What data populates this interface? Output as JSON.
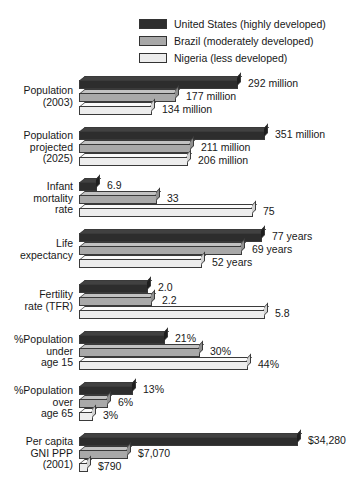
{
  "legend": {
    "items": [
      {
        "label": "United States (highly developed)",
        "key": "us",
        "color": "#2d2d2d"
      },
      {
        "label": "Brazil (moderately developed)",
        "key": "br",
        "color": "#a9a9a9"
      },
      {
        "label": "Nigeria (less developed)",
        "key": "ng",
        "color": "#ededed"
      }
    ]
  },
  "chart_data": {
    "type": "bar",
    "title": "",
    "xlabel": "",
    "ylabel": "",
    "orientation": "horizontal",
    "grid": false,
    "legend_position": "top-right",
    "series": [
      {
        "name": "United States (highly developed)",
        "key": "us",
        "color": "#2d2d2d"
      },
      {
        "name": "Brazil (moderately developed)",
        "key": "br",
        "color": "#a9a9a9"
      },
      {
        "name": "Nigeria (less developed)",
        "key": "ng",
        "color": "#ededed"
      }
    ],
    "groups": [
      {
        "id": "population-2003",
        "label_lines": [
          "Population",
          "(2003)"
        ],
        "unit": "million",
        "bars": [
          {
            "series": "us",
            "value": 292,
            "value_label": "292 million",
            "px": 159
          },
          {
            "series": "br",
            "value": 177,
            "value_label": "177 million",
            "px": 97
          },
          {
            "series": "ng",
            "value": 134,
            "value_label": "134 million",
            "px": 73
          }
        ]
      },
      {
        "id": "population-projected-2025",
        "label_lines": [
          "Population",
          "projected",
          "(2025)"
        ],
        "unit": "million",
        "bars": [
          {
            "series": "us",
            "value": 351,
            "value_label": "351 million",
            "px": 186
          },
          {
            "series": "br",
            "value": 211,
            "value_label": "211 million",
            "px": 112
          },
          {
            "series": "ng",
            "value": 206,
            "value_label": "206 million",
            "px": 109
          }
        ]
      },
      {
        "id": "infant-mortality-rate",
        "label_lines": [
          "Infant",
          "mortality",
          "rate"
        ],
        "unit": "",
        "bars": [
          {
            "series": "us",
            "value": 6.9,
            "value_label": "6.9",
            "px": 18
          },
          {
            "series": "br",
            "value": 33,
            "value_label": "33",
            "px": 78
          },
          {
            "series": "ng",
            "value": 75,
            "value_label": "75",
            "px": 174
          }
        ]
      },
      {
        "id": "life-expectancy",
        "label_lines": [
          "Life",
          "expectancy"
        ],
        "unit": "years",
        "bars": [
          {
            "series": "us",
            "value": 77,
            "value_label": "77 years",
            "px": 183
          },
          {
            "series": "br",
            "value": 69,
            "value_label": "69 years",
            "px": 163
          },
          {
            "series": "ng",
            "value": 52,
            "value_label": "52 years",
            "px": 123
          }
        ]
      },
      {
        "id": "fertility-rate-tfr",
        "label_lines": [
          "Fertility",
          "rate (TFR)"
        ],
        "unit": "",
        "bars": [
          {
            "series": "us",
            "value": 2.0,
            "value_label": "2.0",
            "px": 69
          },
          {
            "series": "br",
            "value": 2.2,
            "value_label": "2.2",
            "px": 73
          },
          {
            "series": "ng",
            "value": 5.8,
            "value_label": "5.8",
            "px": 186
          }
        ]
      },
      {
        "id": "percent-population-under-15",
        "label_lines": [
          "%Population",
          "under",
          "age 15"
        ],
        "unit": "%",
        "bars": [
          {
            "series": "us",
            "value": 21,
            "value_label": "21%",
            "px": 86
          },
          {
            "series": "br",
            "value": 30,
            "value_label": "30%",
            "px": 121
          },
          {
            "series": "ng",
            "value": 44,
            "value_label": "44%",
            "px": 169
          }
        ]
      },
      {
        "id": "percent-population-over-65",
        "label_lines": [
          "%Population",
          "over",
          "age 65"
        ],
        "unit": "%",
        "bars": [
          {
            "series": "us",
            "value": 13,
            "value_label": "13%",
            "px": 54
          },
          {
            "series": "br",
            "value": 6,
            "value_label": "6%",
            "px": 29
          },
          {
            "series": "ng",
            "value": 3,
            "value_label": "3%",
            "px": 14
          }
        ]
      },
      {
        "id": "per-capita-gni-ppp-2001",
        "label_lines": [
          "Per capita",
          "GNI PPP",
          "(2001)"
        ],
        "unit": "$",
        "bars": [
          {
            "series": "us",
            "value": 34280,
            "value_label": "$34,280",
            "px": 219
          },
          {
            "series": "br",
            "value": 7070,
            "value_label": "$7,070",
            "px": 49
          },
          {
            "series": "ng",
            "value": 790,
            "value_label": "$790",
            "px": 9
          }
        ]
      }
    ]
  }
}
